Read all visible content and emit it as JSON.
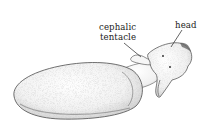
{
  "figure": {
    "labels": {
      "cephalic_line1": "cephalic",
      "cephalic_line2": "tentacle",
      "head": "head"
    },
    "colors": {
      "background": "#ffffff",
      "ink": "#222222",
      "stipple": "#9a9a9a"
    }
  }
}
